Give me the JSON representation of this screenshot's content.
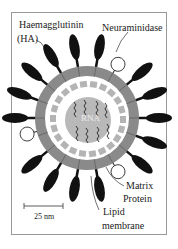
{
  "labels": {
    "ha": "Haemagglutinin",
    "ha_abbr": "(HA)",
    "na": "Neuraminidase",
    "matrix1": "Matrix",
    "matrix2": "Protein",
    "lipid1": "Lipid",
    "lipid2": "membrane",
    "rna": "RNA",
    "scale": "25 nm"
  },
  "colors": {
    "membrane": "#8a8a8a",
    "matrix": "#b4b4b4",
    "core": "#b9b9b9",
    "spike": "#111111"
  }
}
